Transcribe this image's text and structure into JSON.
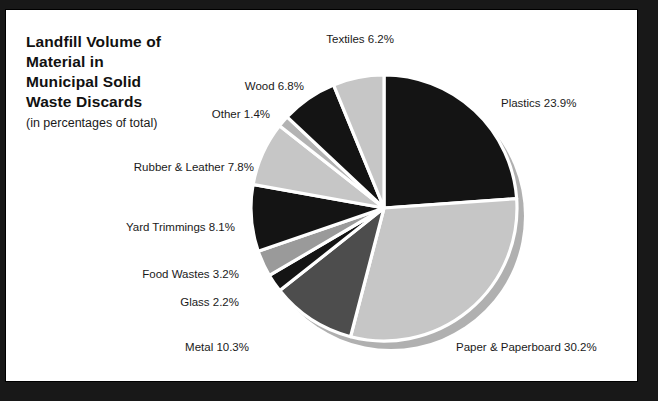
{
  "title": {
    "lines": [
      "Landfill Volume of",
      "Material in",
      "Municipal Solid",
      "Waste Discards"
    ],
    "subtitle": "(in percentages of total)"
  },
  "colors": {
    "background": "#181818",
    "panel": "#ffffff",
    "border": "#000000",
    "dark": "#141414",
    "light_gray": "#c6c6c6",
    "mid_gray": "#4d4d4d",
    "pale_gray": "#b3b3b3",
    "shadow_ring": "#b0b0b0",
    "text": "#1a1a1a"
  },
  "chart_data": {
    "type": "pie",
    "title": "Landfill Volume of Material in Municipal Solid Waste Discards",
    "subtitle": "(in percentages of total)",
    "unit": "percent",
    "start_angle_deg": 0,
    "direction": "clockwise",
    "legend": "none",
    "grid": false,
    "categories": [
      "Plastics",
      "Paper & Paperboard",
      "Metal",
      "Glass",
      "Food Wastes",
      "Yard Trimmings",
      "Rubber & Leather",
      "Other",
      "Wood",
      "Textiles"
    ],
    "values": [
      23.9,
      30.2,
      10.3,
      2.2,
      3.2,
      8.1,
      7.8,
      1.4,
      6.8,
      6.2
    ],
    "slices": [
      {
        "label": "Plastics",
        "value": 23.9,
        "text": "Plastics 23.9%",
        "color": "#141414",
        "side": "right",
        "lx": 500,
        "ly": 96
      },
      {
        "label": "Paper & Paperboard",
        "value": 30.2,
        "text": "Paper & Paperboard 30.2%",
        "color": "#c6c6c6",
        "side": "right",
        "lx": 455,
        "ly": 340
      },
      {
        "label": "Metal",
        "value": 10.3,
        "text": "Metal 10.3%",
        "color": "#4d4d4d",
        "side": "left",
        "lx": 248,
        "ly": 340
      },
      {
        "label": "Glass",
        "value": 2.2,
        "text": "Glass 2.2%",
        "color": "#141414",
        "side": "left",
        "lx": 238,
        "ly": 295
      },
      {
        "label": "Food Wastes",
        "value": 3.2,
        "text": "Food Wastes 3.2%",
        "color": "#9a9a9a",
        "side": "left",
        "lx": 238,
        "ly": 267
      },
      {
        "label": "Yard Trimmings",
        "value": 8.1,
        "text": "Yard Trimmings 8.1%",
        "color": "#141414",
        "side": "left",
        "lx": 234,
        "ly": 220
      },
      {
        "label": "Rubber & Leather",
        "value": 7.8,
        "text": "Rubber & Leather 7.8%",
        "color": "#c6c6c6",
        "side": "left",
        "lx": 253,
        "ly": 160
      },
      {
        "label": "Other",
        "value": 1.4,
        "text": "Other 1.4%",
        "color": "#b3b3b3",
        "side": "left",
        "lx": 269,
        "ly": 107
      },
      {
        "label": "Wood",
        "value": 6.8,
        "text": "Wood 6.8%",
        "color": "#141414",
        "side": "left",
        "lx": 303,
        "ly": 79
      },
      {
        "label": "Textiles",
        "value": 6.2,
        "text": "Textiles 6.2%",
        "color": "#c6c6c6",
        "side": "left",
        "lx": 393,
        "ly": 32
      }
    ],
    "total": 100.1
  },
  "geometry": {
    "center_x": 383,
    "center_y": 207,
    "radius": 133
  }
}
